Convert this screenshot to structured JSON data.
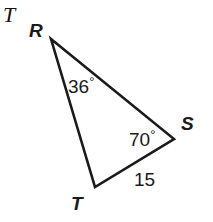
{
  "figure": {
    "tag": "T",
    "background_color": "#ffffff",
    "stroke_color": "#1a1a1a",
    "text_color": "#1a1a1a",
    "width": 213,
    "height": 222
  },
  "vertices": [
    {
      "name": "R",
      "label": "R",
      "x": 51,
      "y": 39
    },
    {
      "name": "S",
      "label": "S",
      "x": 174,
      "y": 139
    },
    {
      "name": "T",
      "label": "T",
      "x": 95,
      "y": 187
    }
  ],
  "angles": [
    {
      "at": "R",
      "value": "36",
      "unit": "°",
      "label": "36°"
    },
    {
      "at": "S",
      "value": "70",
      "unit": "°",
      "label": "70°"
    }
  ],
  "sides": [
    {
      "between": "TS",
      "label": "15",
      "value": "15"
    }
  ],
  "chart_data": {
    "type": "diagram",
    "shape": "triangle",
    "title": "",
    "points": {
      "R": [
        51,
        39
      ],
      "S": [
        174,
        139
      ],
      "T": [
        95,
        187
      ]
    },
    "edges": [
      [
        "R",
        "S"
      ],
      [
        "S",
        "T"
      ],
      [
        "T",
        "R"
      ]
    ],
    "angle_measures": {
      "R": 36,
      "S": 70
    },
    "side_lengths": {
      "TS": 15
    },
    "units": "degrees"
  }
}
